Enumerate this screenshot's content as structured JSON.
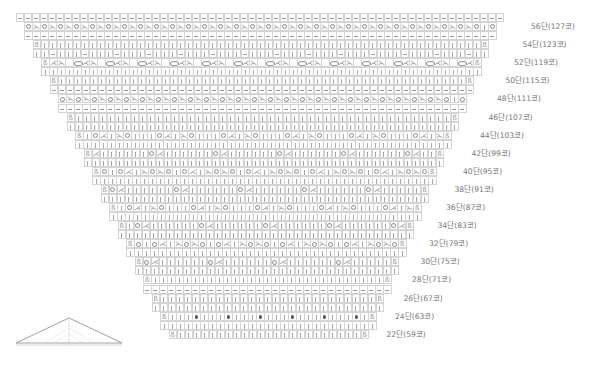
{
  "chart_title": "Knitting chart (triangle shawl, rows 22–57)",
  "symbols": {
    "dash": "purl (−)",
    "knit": "knit (|)",
    "yo": "yarn over (O)",
    "bigyo": "yarn over (large O)",
    "ssk": "left-leaning decrease (⋋)",
    "k2t": "right-leaning decrease (⋌)",
    "bobble": "bobble (●)",
    "edge": "edge stitch (ß symbol)"
  },
  "row_labels": [
    {
      "row": 56,
      "text": "56단(127코)"
    },
    {
      "row": 54,
      "text": "54단(123코)"
    },
    {
      "row": 52,
      "text": "52단(119코)"
    },
    {
      "row": 50,
      "text": "50단(115코)"
    },
    {
      "row": 48,
      "text": "48단(111코)"
    },
    {
      "row": 46,
      "text": "46단(107코)"
    },
    {
      "row": 44,
      "text": "44단(103코)"
    },
    {
      "row": 42,
      "text": "42단(99코)"
    },
    {
      "row": 40,
      "text": "40단(95코)"
    },
    {
      "row": 38,
      "text": "38단(91코)"
    },
    {
      "row": 36,
      "text": "36단(87코)"
    },
    {
      "row": 34,
      "text": "34단(83코)"
    },
    {
      "row": 32,
      "text": "32단(79코)"
    },
    {
      "row": 30,
      "text": "30단(75코)"
    },
    {
      "row": 28,
      "text": "28단(71코)"
    },
    {
      "row": 26,
      "text": "26단(67코)"
    },
    {
      "row": 24,
      "text": "24단(63코)"
    },
    {
      "row": 22,
      "text": "22단(59코)"
    }
  ],
  "rows": [
    {
      "type": "dash",
      "label": null
    },
    {
      "type": "yo56",
      "label": 0
    },
    {
      "type": "dash",
      "label": null
    },
    {
      "type": "knitE",
      "label": 1
    },
    {
      "type": "knitP",
      "label": null
    },
    {
      "type": "big52",
      "label": 2
    },
    {
      "type": "knit",
      "label": null
    },
    {
      "type": "knitE",
      "label": 3
    },
    {
      "type": "dash",
      "label": null
    },
    {
      "type": "yo56",
      "label": 4
    },
    {
      "type": "dash",
      "label": null
    },
    {
      "type": "knitE",
      "label": 5
    },
    {
      "type": "knit",
      "label": null
    },
    {
      "type": "lace44",
      "label": 6
    },
    {
      "type": "knit",
      "label": null
    },
    {
      "type": "lace42",
      "label": 7
    },
    {
      "type": "knit",
      "label": null
    },
    {
      "type": "lace40",
      "label": 8
    },
    {
      "type": "knit",
      "label": null
    },
    {
      "type": "lace38",
      "label": 9
    },
    {
      "type": "knit",
      "label": null
    },
    {
      "type": "lace44",
      "label": 10
    },
    {
      "type": "knit",
      "label": null
    },
    {
      "type": "lace34",
      "label": 11
    },
    {
      "type": "knit",
      "label": null
    },
    {
      "type": "lace40",
      "label": 12
    },
    {
      "type": "knit",
      "label": null
    },
    {
      "type": "lace38",
      "label": 13
    },
    {
      "type": "knit",
      "label": null
    },
    {
      "type": "knitE",
      "label": 14
    },
    {
      "type": "dash",
      "label": null
    },
    {
      "type": "knitE",
      "label": 15
    },
    {
      "type": "knit",
      "label": null
    },
    {
      "type": "bobble",
      "label": 16
    },
    {
      "type": "knit",
      "label": null
    },
    {
      "type": "knitE",
      "label": 17
    }
  ],
  "shape_diagram": {
    "name": "triangle shawl schematic"
  }
}
